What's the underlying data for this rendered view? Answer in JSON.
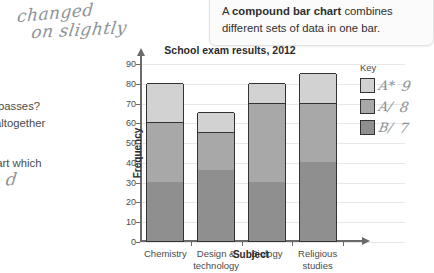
{
  "callout": {
    "lead": "A ",
    "bold": "compound bar chart",
    "rest": " combines different sets of data in one bar."
  },
  "annotations": {
    "handwritten": [
      {
        "name": "changed-note-line1",
        "text": "changed"
      },
      {
        "name": "changed-note-line2",
        "text": "on slightly"
      },
      {
        "name": "td-note",
        "text": "t d"
      }
    ],
    "clipped_text": [
      {
        "name": "passes-text",
        "text": "passes?"
      },
      {
        "name": "altogether-text",
        "text": "altogether"
      },
      {
        "name": "chart-which-text",
        "text": "hart which"
      }
    ]
  },
  "key": {
    "title": "Key",
    "items": [
      {
        "grade": "A*",
        "count": "9",
        "color": "#d2d2d2"
      },
      {
        "grade": "A/",
        "count": "8",
        "color": "#a8a8a8"
      },
      {
        "grade": "B/",
        "count": "7",
        "color": "#8f8f8f"
      }
    ]
  },
  "chart_data": {
    "type": "bar",
    "title": "School exam results, 2012",
    "xlabel": "Subject",
    "ylabel": "Frequency",
    "ylim": [
      0,
      90
    ],
    "yticks": [
      0,
      10,
      20,
      30,
      40,
      50,
      60,
      70,
      80,
      90
    ],
    "grid": true,
    "stacked": true,
    "legend_position": "right",
    "categories": [
      "Chemistry",
      "Design & technology",
      "Biology",
      "Religious studies"
    ],
    "category_lines": [
      [
        "Chemistry"
      ],
      [
        "Design &",
        "technology"
      ],
      [
        "Biology"
      ],
      [
        "Religious",
        "studies"
      ]
    ],
    "series": [
      {
        "name": "B/",
        "color": "#8f8f8f",
        "values": [
          30,
          36,
          30,
          40
        ]
      },
      {
        "name": "A/",
        "color": "#a8a8a8",
        "values": [
          30,
          19,
          40,
          30
        ]
      },
      {
        "name": "A*",
        "color": "#d2d2d2",
        "values": [
          20,
          10,
          10,
          15
        ]
      }
    ],
    "totals": [
      80,
      65,
      80,
      85
    ]
  }
}
